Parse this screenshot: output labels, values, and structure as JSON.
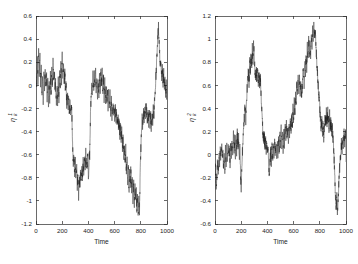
{
  "figure": {
    "background": "#ffffff",
    "trace_color": "#1c1c1c",
    "axis_color": "#2b2b2b",
    "panel_count": 2
  },
  "chart_data": [
    {
      "type": "line",
      "panel": "left",
      "title": "",
      "xlabel": "Time",
      "ylabel": "eta_k^1",
      "ylabel_base": "η",
      "ylabel_sub": "k",
      "ylabel_sup": "1",
      "xlim": [
        0,
        1000
      ],
      "ylim": [
        -1.2,
        0.6
      ],
      "xticks": [
        0,
        200,
        400,
        600,
        800,
        1000
      ],
      "xticklabels": [
        "0",
        "200",
        "400",
        "600",
        "800",
        "1000"
      ],
      "yticks": [
        -1.2,
        -1,
        -0.8,
        -0.6,
        -0.4,
        -0.2,
        0,
        0.2,
        0.4,
        0.6
      ],
      "yticklabels": [
        "-1.2",
        "-1",
        "-0.8",
        "-0.6",
        "-0.4",
        "-0.2",
        "0",
        "0.2",
        "0.4",
        "0.6"
      ],
      "grid": false,
      "legend": null,
      "x": [
        0,
        5,
        10,
        15,
        20,
        25,
        30,
        35,
        40,
        45,
        50,
        55,
        60,
        65,
        70,
        75,
        80,
        85,
        90,
        95,
        100,
        105,
        110,
        115,
        120,
        125,
        130,
        135,
        140,
        145,
        150,
        155,
        160,
        165,
        170,
        175,
        180,
        185,
        190,
        195,
        200,
        205,
        210,
        215,
        220,
        225,
        230,
        235,
        240,
        245,
        250,
        255,
        260,
        265,
        270,
        275,
        280,
        285,
        290,
        295,
        300,
        305,
        310,
        315,
        320,
        325,
        330,
        335,
        340,
        345,
        350,
        355,
        360,
        365,
        370,
        375,
        380,
        385,
        390,
        395,
        400,
        405,
        410,
        415,
        420,
        425,
        430,
        435,
        440,
        445,
        450,
        455,
        460,
        465,
        470,
        475,
        480,
        485,
        490,
        495,
        500,
        505,
        510,
        515,
        520,
        525,
        530,
        535,
        540,
        545,
        550,
        555,
        560,
        565,
        570,
        575,
        580,
        585,
        590,
        595,
        600,
        605,
        610,
        615,
        620,
        625,
        630,
        635,
        640,
        645,
        650,
        655,
        660,
        665,
        670,
        675,
        680,
        685,
        690,
        695,
        700,
        705,
        710,
        715,
        720,
        725,
        730,
        735,
        740,
        745,
        750,
        755,
        760,
        765,
        770,
        775,
        780,
        785,
        790,
        795,
        800,
        805,
        810,
        815,
        820,
        825,
        830,
        835,
        840,
        845,
        850,
        855,
        860,
        865,
        870,
        875,
        880,
        885,
        890,
        895,
        900,
        905,
        910,
        915,
        920,
        925,
        930,
        935,
        940,
        945,
        950,
        955,
        960,
        965,
        970,
        975,
        980,
        985,
        990,
        995,
        1000
      ],
      "values": [
        0.1,
        -0.05,
        0.22,
        0.05,
        0.34,
        0.12,
        0.26,
        0.02,
        0.18,
        -0.08,
        0.06,
        -0.2,
        0.1,
        -0.02,
        0.16,
        0.0,
        0.12,
        -0.1,
        0.04,
        -0.18,
        0.02,
        -0.12,
        0.08,
        -0.06,
        0.14,
        0.0,
        0.2,
        0.05,
        0.12,
        -0.04,
        0.02,
        -0.16,
        -0.02,
        -0.14,
        0.04,
        -0.1,
        0.1,
        -0.02,
        0.18,
        0.05,
        0.26,
        0.1,
        0.2,
        0.02,
        0.12,
        -0.08,
        0.04,
        -0.2,
        -0.05,
        -0.22,
        -0.1,
        -0.24,
        -0.14,
        -0.26,
        -0.16,
        -0.3,
        -0.55,
        -0.7,
        -0.6,
        -0.78,
        -0.66,
        -0.8,
        -0.7,
        -0.88,
        -0.74,
        -0.96,
        -0.8,
        -0.86,
        -0.72,
        -0.84,
        -0.7,
        -0.8,
        -0.66,
        -0.78,
        -0.64,
        -0.7,
        -0.58,
        -0.66,
        -0.72,
        -0.6,
        -0.82,
        -0.64,
        -0.6,
        -0.3,
        -0.1,
        0.02,
        -0.06,
        0.08,
        -0.02,
        0.12,
        0.0,
        0.1,
        -0.04,
        0.06,
        -0.08,
        0.04,
        -0.12,
        0.08,
        -0.04,
        0.12,
        0.02,
        0.1,
        -0.06,
        0.06,
        -0.1,
        0.02,
        -0.14,
        -0.02,
        -0.16,
        -0.04,
        -0.18,
        -0.06,
        -0.2,
        -0.08,
        -0.22,
        -0.12,
        -0.26,
        -0.14,
        -0.24,
        -0.16,
        -0.28,
        -0.18,
        -0.3,
        -0.22,
        -0.34,
        -0.26,
        -0.38,
        -0.3,
        -0.42,
        -0.34,
        -0.46,
        -0.38,
        -0.56,
        -0.44,
        -0.64,
        -0.5,
        -0.7,
        -0.56,
        -0.76,
        -0.62,
        -0.86,
        -0.68,
        -0.92,
        -0.74,
        -0.84,
        -0.7,
        -0.9,
        -0.76,
        -0.98,
        -0.82,
        -1.05,
        -0.88,
        -1.0,
        -0.9,
        -1.1,
        -0.94,
        -1.14,
        -1.0,
        -1.08,
        -0.8,
        -0.56,
        -0.4,
        -0.28,
        -0.36,
        -0.22,
        -0.3,
        -0.18,
        -0.26,
        -0.16,
        -0.24,
        -0.3,
        -0.2,
        -0.34,
        -0.22,
        -0.36,
        -0.24,
        -0.38,
        -0.26,
        -0.32,
        -0.2,
        -0.28,
        -0.12,
        -0.04,
        0.06,
        0.16,
        0.3,
        0.42,
        0.5,
        0.36,
        0.24,
        0.14,
        0.2,
        0.08,
        0.14,
        0.02,
        0.1,
        -0.04,
        0.06,
        -0.1,
        0.02,
        -0.16,
        0.04,
        -0.08,
        0.1,
        0.0,
        -0.06
      ]
    },
    {
      "type": "line",
      "panel": "right",
      "title": "",
      "xlabel": "Time",
      "ylabel": "eta_k^2",
      "ylabel_base": "η",
      "ylabel_sub": "k",
      "ylabel_sup": "2",
      "xlim": [
        0,
        1000
      ],
      "ylim": [
        -0.6,
        1.2
      ],
      "xticks": [
        0,
        200,
        400,
        600,
        800,
        1000
      ],
      "xticklabels": [
        "0",
        "200",
        "400",
        "600",
        "800",
        "1000"
      ],
      "yticks": [
        -0.6,
        -0.4,
        -0.2,
        0,
        0.2,
        0.4,
        0.6,
        0.8,
        1,
        1.2
      ],
      "yticklabels": [
        "-0.6",
        "-0.4",
        "-0.2",
        "0",
        "0.2",
        "0.4",
        "0.6",
        "0.8",
        "1",
        "1.2"
      ],
      "grid": false,
      "legend": null,
      "x": [
        0,
        5,
        10,
        15,
        20,
        25,
        30,
        35,
        40,
        45,
        50,
        55,
        60,
        65,
        70,
        75,
        80,
        85,
        90,
        95,
        100,
        105,
        110,
        115,
        120,
        125,
        130,
        135,
        140,
        145,
        150,
        155,
        160,
        165,
        170,
        175,
        180,
        185,
        190,
        195,
        200,
        205,
        210,
        215,
        220,
        225,
        230,
        235,
        240,
        245,
        250,
        255,
        260,
        265,
        270,
        275,
        280,
        285,
        290,
        295,
        300,
        305,
        310,
        315,
        320,
        325,
        330,
        335,
        340,
        345,
        350,
        355,
        360,
        365,
        370,
        375,
        380,
        385,
        390,
        395,
        400,
        405,
        410,
        415,
        420,
        425,
        430,
        435,
        440,
        445,
        450,
        455,
        460,
        465,
        470,
        475,
        480,
        485,
        490,
        495,
        500,
        505,
        510,
        515,
        520,
        525,
        530,
        535,
        540,
        545,
        550,
        555,
        560,
        565,
        570,
        575,
        580,
        585,
        590,
        595,
        600,
        605,
        610,
        615,
        620,
        625,
        630,
        635,
        640,
        645,
        650,
        655,
        660,
        665,
        670,
        675,
        680,
        685,
        690,
        695,
        700,
        705,
        710,
        715,
        720,
        725,
        730,
        735,
        740,
        745,
        750,
        755,
        760,
        765,
        770,
        775,
        780,
        785,
        790,
        795,
        800,
        805,
        810,
        815,
        820,
        825,
        830,
        835,
        840,
        845,
        850,
        855,
        860,
        865,
        870,
        875,
        880,
        885,
        890,
        895,
        900,
        905,
        910,
        915,
        920,
        925,
        930,
        935,
        940,
        945,
        950,
        955,
        960,
        965,
        970,
        975,
        980,
        985,
        990,
        995,
        1000
      ],
      "values": [
        -0.06,
        -0.2,
        -0.34,
        -0.14,
        -0.02,
        -0.16,
        0.02,
        -0.1,
        0.06,
        -0.06,
        0.1,
        -0.02,
        0.04,
        -0.12,
        0.0,
        -0.14,
        0.04,
        -0.08,
        0.08,
        -0.04,
        0.12,
        0.0,
        0.06,
        -0.08,
        0.1,
        -0.02,
        0.14,
        0.02,
        0.18,
        0.04,
        0.12,
        -0.02,
        0.16,
        0.02,
        0.2,
        0.06,
        0.14,
        -0.04,
        0.08,
        -0.18,
        -0.28,
        -0.12,
        0.04,
        0.16,
        0.26,
        0.34,
        0.42,
        0.3,
        0.46,
        0.56,
        0.66,
        0.74,
        0.62,
        0.8,
        0.7,
        0.86,
        0.76,
        0.92,
        0.8,
        1.0,
        0.84,
        0.72,
        0.66,
        0.74,
        0.64,
        0.72,
        0.62,
        0.7,
        0.6,
        0.68,
        0.56,
        0.44,
        0.3,
        0.2,
        0.12,
        0.18,
        0.08,
        0.14,
        0.04,
        0.1,
        0.0,
        0.06,
        -0.1,
        -0.2,
        -0.06,
        0.04,
        -0.06,
        0.08,
        -0.02,
        0.1,
        0.0,
        0.12,
        0.02,
        0.08,
        -0.04,
        0.1,
        0.0,
        0.14,
        0.04,
        0.18,
        0.08,
        0.22,
        0.1,
        0.16,
        0.06,
        0.2,
        0.1,
        0.24,
        0.14,
        0.28,
        0.16,
        0.22,
        0.12,
        0.26,
        0.16,
        0.3,
        0.2,
        0.34,
        0.24,
        0.4,
        0.3,
        0.46,
        0.36,
        0.54,
        0.42,
        0.62,
        0.5,
        0.7,
        0.56,
        0.66,
        0.54,
        0.62,
        0.5,
        0.58,
        0.66,
        0.74,
        0.62,
        0.8,
        0.7,
        0.86,
        0.76,
        0.94,
        0.82,
        1.0,
        0.88,
        0.96,
        0.84,
        1.04,
        0.92,
        1.1,
        0.98,
        1.14,
        1.02,
        1.08,
        0.96,
        0.86,
        0.74,
        0.66,
        0.56,
        0.48,
        0.4,
        0.32,
        0.24,
        0.3,
        0.2,
        0.26,
        0.16,
        0.24,
        0.34,
        0.26,
        0.36,
        0.28,
        0.38,
        0.3,
        0.24,
        0.34,
        0.22,
        0.3,
        0.2,
        0.26,
        0.14,
        0.06,
        -0.06,
        -0.22,
        -0.36,
        -0.46,
        -0.34,
        -0.5,
        -0.38,
        -0.26,
        -0.14,
        -0.06,
        0.02,
        0.1,
        0.04,
        0.14,
        0.06,
        0.18,
        0.1,
        0.22,
        0.12,
        0.04,
        -0.08,
        -0.02,
        -0.12,
        -0.06
      ]
    }
  ]
}
